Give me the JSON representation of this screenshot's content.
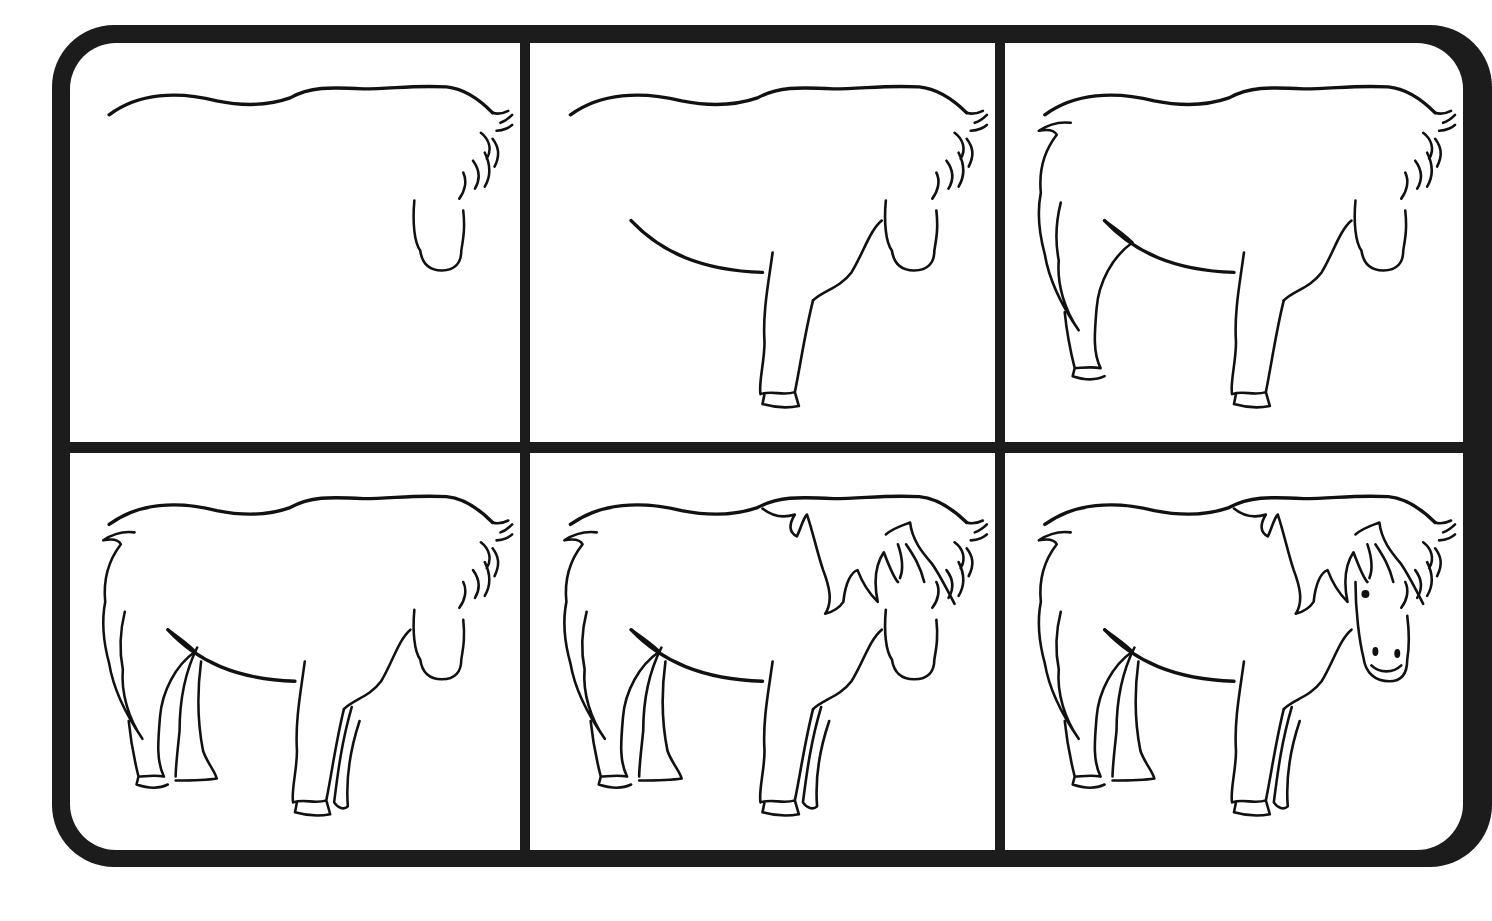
{
  "diagram": {
    "layout": {
      "rows": 2,
      "columns": 3
    },
    "colors": {
      "frame": "#1c1c1c",
      "panel_background": "#ffffff",
      "line": "#111111"
    },
    "steps": [
      {
        "index": 1,
        "name": "back-and-neck",
        "description": "Back line, neck with mane tufts, muzzle outline",
        "parts": [
          "back",
          "mane-neck",
          "muzzle"
        ]
      },
      {
        "index": 2,
        "name": "belly-front-leg",
        "description": "Add belly curve, chest and front leg with hoof",
        "parts": [
          "back",
          "mane-neck",
          "muzzle",
          "belly",
          "chest",
          "front-leg-near"
        ]
      },
      {
        "index": 3,
        "name": "tail-hind-leg",
        "description": "Add tail and near hind leg with hoof",
        "parts": [
          "back",
          "mane-neck",
          "muzzle",
          "belly",
          "chest",
          "front-leg-near",
          "tail",
          "hind-leg-near"
        ]
      },
      {
        "index": 4,
        "name": "far-legs",
        "description": "Add far hind leg and far front leg",
        "parts": [
          "back",
          "mane-neck",
          "muzzle",
          "belly",
          "chest",
          "front-leg-near",
          "tail",
          "hind-leg-near",
          "hind-leg-far",
          "front-leg-far"
        ]
      },
      {
        "index": 5,
        "name": "mane-forelock",
        "description": "Add flowing mane over shoulder and forelock",
        "parts": [
          "back",
          "mane-neck",
          "muzzle",
          "belly",
          "chest",
          "front-leg-near",
          "tail",
          "hind-leg-near",
          "hind-leg-far",
          "front-leg-far",
          "mane-long",
          "forelock"
        ]
      },
      {
        "index": 6,
        "name": "face-details",
        "description": "Add face outline, eye, nostrils and mouth",
        "parts": [
          "back",
          "mane-neck",
          "belly",
          "chest",
          "front-leg-near",
          "tail",
          "hind-leg-near",
          "hind-leg-far",
          "front-leg-far",
          "mane-long",
          "forelock",
          "face",
          "eye",
          "nostrils",
          "mouth"
        ]
      }
    ]
  }
}
